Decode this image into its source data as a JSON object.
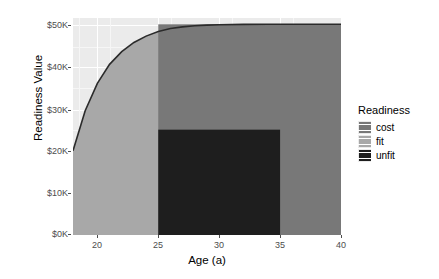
{
  "chart_data": {
    "type": "area",
    "title": "",
    "xlabel": "Age (a)",
    "ylabel": "Readiness Value",
    "xlim": [
      18,
      40
    ],
    "ylim": [
      0,
      51500
    ],
    "grid": true,
    "legend_position": "right",
    "xticks": [
      {
        "value": 20,
        "label": "20"
      },
      {
        "value": 25,
        "label": "25"
      },
      {
        "value": 30,
        "label": "30"
      },
      {
        "value": 35,
        "label": "35"
      },
      {
        "value": 40,
        "label": "40"
      }
    ],
    "yticks": [
      {
        "value": 0,
        "label": "$0K"
      },
      {
        "value": 10000,
        "label": "$10K"
      },
      {
        "value": 20000,
        "label": "$20K"
      },
      {
        "value": 30000,
        "label": "$30K"
      },
      {
        "value": 40000,
        "label": "$40K"
      },
      {
        "value": 50000,
        "label": "$50K"
      }
    ],
    "legend": {
      "title": "Readiness",
      "entries": [
        {
          "name": "cost",
          "color": "#787878"
        },
        {
          "name": "fit",
          "color": "#a8a8a8"
        },
        {
          "name": "unfit",
          "color": "#1e1e1e"
        }
      ]
    },
    "series": [
      {
        "name": "fit",
        "type": "area",
        "color": "#a8a8a8",
        "x": [
          18,
          19,
          20,
          21,
          22,
          23,
          24,
          25,
          26,
          27,
          28,
          29,
          30,
          32,
          34,
          36,
          38,
          40
        ],
        "y": [
          20000,
          29500,
          36000,
          40500,
          43500,
          45700,
          47200,
          48300,
          49000,
          49400,
          49650,
          49800,
          49900,
          49980,
          50000,
          50000,
          50000,
          50000
        ]
      },
      {
        "name": "cost",
        "type": "rect",
        "color": "#787878",
        "x_range": [
          25,
          40
        ],
        "y_range": [
          0,
          50000
        ]
      },
      {
        "name": "unfit",
        "type": "rect",
        "color": "#1e1e1e",
        "x_range": [
          25,
          35
        ],
        "y_range": [
          0,
          25000
        ]
      }
    ],
    "curve_line_color": "#2b2b2b",
    "panel_background": "#ebebeb",
    "gridline_color": "#ffffff"
  }
}
